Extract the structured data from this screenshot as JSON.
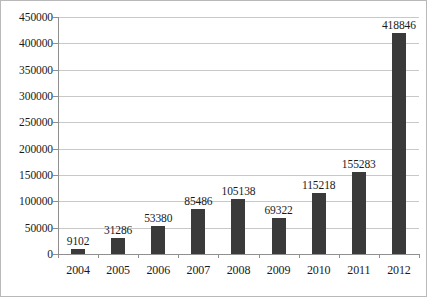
{
  "chart_data": {
    "type": "bar",
    "title": "",
    "subtitle": "",
    "xlabel": "",
    "ylabel": "",
    "categories": [
      "2004",
      "2005",
      "2006",
      "2007",
      "2008",
      "2009",
      "2010",
      "2011",
      "2012"
    ],
    "values": [
      9102,
      31286,
      53380,
      85486,
      105138,
      69322,
      115218,
      155283,
      418846
    ],
    "data_labels": [
      "9102",
      "31286",
      "53380",
      "85486",
      "105138",
      "69322",
      "115218",
      "155283",
      "418846"
    ],
    "ylim": [
      0,
      450000
    ],
    "y_ticks": [
      0,
      50000,
      100000,
      150000,
      200000,
      250000,
      300000,
      350000,
      400000,
      450000
    ],
    "y_tick_labels": [
      "0",
      "50000",
      "100000",
      "150000",
      "200000",
      "250000",
      "300000",
      "350000",
      "400000",
      "450000"
    ],
    "grid": true,
    "legend": "none",
    "bar_color": "#3a3a3a",
    "gridline_color": "#c8c8c8",
    "axis_color": "#8f8f8f",
    "background_color": "#ffffff"
  }
}
